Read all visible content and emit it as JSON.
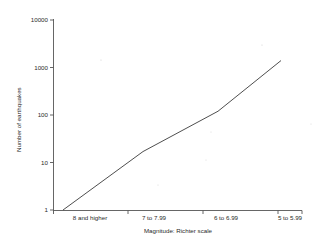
{
  "chart_data": {
    "type": "line",
    "title": "",
    "xlabel": "Magnitude: Richter scale",
    "ylabel": "Number of earthquakes",
    "categories": [
      "8 and higher",
      "7 to 7.99",
      "6 to 6.99",
      "5 to 5.99"
    ],
    "values": [
      1,
      17,
      120,
      1400
    ],
    "series": [
      {
        "name": "Number of earthquakes",
        "values": [
          1,
          17,
          120,
          1400
        ]
      }
    ],
    "yscale": "log",
    "ylim": [
      1,
      10000
    ],
    "yticks": [
      "1",
      "10",
      "100",
      "1000",
      "10000"
    ],
    "ytick_values": [
      1,
      10,
      100,
      1000,
      10000
    ],
    "xticks": [
      "8 and higher",
      "7 to 7.99",
      "6 to 6.99",
      "5 to 5.99"
    ],
    "grid": false,
    "legend": false,
    "legend_position": "none",
    "colors": {
      "line": "#3a3a3a",
      "axis": "#555555",
      "text": "#2a2a2a",
      "background": "#ffffff"
    }
  },
  "axes": {
    "y": {
      "title": "Number of earthquakes",
      "labels": [
        "10000",
        "1000",
        "100",
        "10",
        "1"
      ]
    },
    "x": {
      "title": "Magnitude: Richter scale",
      "labels": [
        "8 and higher",
        "7 to 7.99",
        "6 to 6.99",
        "5 to 5.99"
      ]
    }
  }
}
